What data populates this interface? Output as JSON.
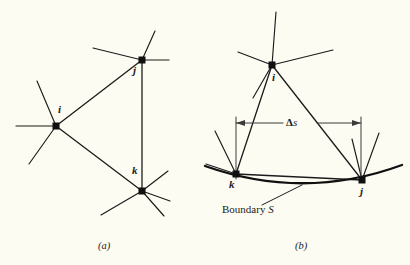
{
  "figure": {
    "background_color": "#fdfcf3",
    "ink_color": "#1b1b1b",
    "panels": [
      {
        "id": "panel-a",
        "caption": "(a)",
        "nodes": [
          {
            "id": "i",
            "label": "i",
            "x": 56,
            "y": 126
          },
          {
            "id": "j",
            "label": "j",
            "x": 142,
            "y": 60
          },
          {
            "id": "k",
            "label": "k",
            "x": 142,
            "y": 191
          }
        ],
        "triangle_edges": [
          {
            "from": "i",
            "to": "j"
          },
          {
            "from": "j",
            "to": "k"
          },
          {
            "from": "k",
            "to": "i"
          }
        ]
      },
      {
        "id": "panel-b",
        "caption": "(b)",
        "nodes": [
          {
            "id": "i",
            "label": "i",
            "x": 272,
            "y": 65
          },
          {
            "id": "k",
            "label": "k",
            "x": 236,
            "y": 174
          },
          {
            "id": "j",
            "label": "j",
            "x": 362,
            "y": 180
          }
        ],
        "triangle_edges": [
          {
            "from": "i",
            "to": "j"
          },
          {
            "from": "j",
            "to": "k"
          },
          {
            "from": "k",
            "to": "i"
          }
        ],
        "dimension": {
          "label": "Δs",
          "label_greek": "Δ",
          "label_italic": "s",
          "y": 123,
          "x_left": 236,
          "x_right": 361
        },
        "boundary": {
          "label_prefix": "Boundary ",
          "label_symbol": "S",
          "label_x": 222,
          "label_y": 210
        }
      }
    ]
  }
}
